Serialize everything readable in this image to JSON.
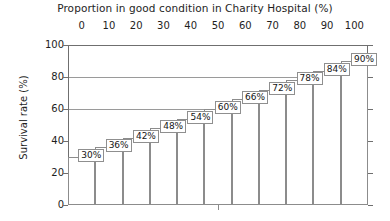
{
  "chart_data": {
    "type": "bar",
    "title": "Proportion in good condition in Charity Hospital (%)",
    "xlabel": "Proportion in good condition in Charity Hospital (%)",
    "ylabel": "Survival rate (%)",
    "categories": [
      "0",
      "10",
      "20",
      "30",
      "40",
      "50",
      "60",
      "70",
      "80",
      "90",
      "100"
    ],
    "values": [
      30,
      36,
      42,
      48,
      54,
      60,
      66,
      72,
      78,
      84,
      90
    ],
    "data_labels": [
      "30%",
      "36%",
      "42%",
      "48%",
      "54%",
      "60%",
      "66%",
      "72%",
      "78%",
      "84%",
      "90%"
    ],
    "ylim": [
      0,
      100
    ],
    "ytick_labels": [
      "0",
      "20",
      "40",
      "60",
      "80",
      "100"
    ],
    "ytick_values": [
      0,
      20,
      40,
      60,
      80,
      100
    ],
    "xtick_labels": [
      "0",
      "10",
      "20",
      "30",
      "40",
      "50",
      "60",
      "70",
      "80",
      "90",
      "100"
    ],
    "xtick_values": [
      0,
      10,
      20,
      30,
      40,
      50,
      60,
      70,
      80,
      90,
      100
    ],
    "xaxis_position": "top",
    "grid": true,
    "gridlines_at": [
      60,
      80,
      100
    ],
    "legend": false,
    "legend_position": "none",
    "bar_fill_color": "#ffffff",
    "bar_border_color": "#8c8c8c",
    "axis_color": "#6f6f6f",
    "grid_color": "#9a9a9a",
    "text_color": "#1e1e1e",
    "background_color": "#ffffff"
  }
}
